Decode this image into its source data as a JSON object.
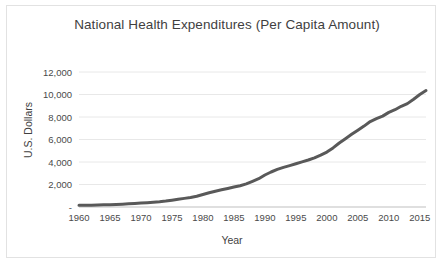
{
  "chart_data": {
    "type": "line",
    "title": "National Health Expenditures (Per Capita Amount)",
    "xlabel": "Year",
    "ylabel": "U.S. Dollars",
    "xlim": [
      1960,
      2016
    ],
    "ylim": [
      0,
      12000
    ],
    "grid": true,
    "legend": "none",
    "line_color": "#595959",
    "gridline_color": "#E8E8E8",
    "border_color": "#E2E2E2",
    "ytick_labels": [
      "12,000",
      "10,000",
      "8,000",
      "6,000",
      "4,000",
      "2,000",
      "-"
    ],
    "ytick_values": [
      12000,
      10000,
      8000,
      6000,
      4000,
      2000,
      0
    ],
    "xtick_labels": [
      "1960",
      "1965",
      "1970",
      "1975",
      "1980",
      "1985",
      "1990",
      "1995",
      "2000",
      "2005",
      "2010",
      "2015"
    ],
    "xtick_values": [
      1960,
      1965,
      1970,
      1975,
      1980,
      1985,
      1990,
      1995,
      2000,
      2005,
      2010,
      2015
    ],
    "series": [
      {
        "name": "National Health Expenditures Per Capita",
        "x": [
          1960,
          1961,
          1962,
          1963,
          1964,
          1965,
          1966,
          1967,
          1968,
          1969,
          1970,
          1971,
          1972,
          1973,
          1974,
          1975,
          1976,
          1977,
          1978,
          1979,
          1980,
          1981,
          1982,
          1983,
          1984,
          1985,
          1986,
          1987,
          1988,
          1989,
          1990,
          1991,
          1992,
          1993,
          1994,
          1995,
          1996,
          1997,
          1998,
          1999,
          2000,
          2001,
          2002,
          2003,
          2004,
          2005,
          2006,
          2007,
          2008,
          2009,
          2010,
          2011,
          2012,
          2013,
          2014,
          2015,
          2016
        ],
        "values": [
          146,
          154,
          164,
          176,
          192,
          205,
          223,
          250,
          281,
          313,
          353,
          387,
          427,
          469,
          527,
          605,
          686,
          767,
          852,
          955,
          1108,
          1266,
          1406,
          1527,
          1648,
          1775,
          1890,
          2058,
          2288,
          2513,
          2843,
          3111,
          3341,
          3527,
          3681,
          3844,
          4006,
          4178,
          4372,
          4607,
          4881,
          5251,
          5686,
          6072,
          6458,
          6827,
          7191,
          7595,
          7848,
          8076,
          8412,
          8646,
          8951,
          9188,
          9577,
          9994,
          10348
        ]
      }
    ]
  },
  "chart": {
    "title": "National Health Expenditures (Per Capita Amount)",
    "x_axis_title": "Year",
    "y_axis_title": "U.S. Dollars"
  }
}
